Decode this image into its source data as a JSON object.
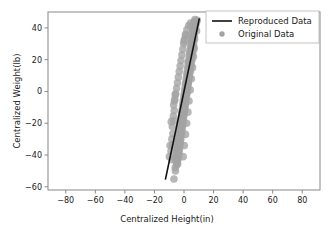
{
  "chart_data": {
    "type": "scatter",
    "title": "",
    "xlabel": "Centralized Height(in)",
    "ylabel": "Centralized Weight(lb)",
    "xlim": [
      -92,
      92
    ],
    "ylim": [
      -62,
      50
    ],
    "xticks": [
      -80,
      -60,
      -40,
      -20,
      0,
      20,
      40,
      60,
      80
    ],
    "xtick_labels": [
      "−80",
      "−60",
      "−40",
      "−20",
      "0",
      "20",
      "40",
      "60",
      "80"
    ],
    "yticks": [
      40,
      20,
      0,
      -20,
      -40,
      -60
    ],
    "ytick_labels": [
      "40",
      "20",
      "0",
      "−20",
      "−40",
      "−60"
    ],
    "grid": false,
    "legend_position": "upper right",
    "legend": [
      {
        "label": "Reproduced Data",
        "kind": "line",
        "color": "#101010"
      },
      {
        "label": "Original Data",
        "kind": "marker",
        "color": "#a3a3a3"
      }
    ],
    "series": [
      {
        "name": "Reproduced Data",
        "type": "line",
        "color": "#101010",
        "linewidth": 1.6,
        "x": [
          -12.6,
          10.4
        ],
        "y": [
          -55.5,
          46.0
        ]
      },
      {
        "name": "Original Data",
        "type": "scatter",
        "color": "#a3a3a3",
        "marker": "o",
        "marker_size": 5.2,
        "points": [
          [
            7.4,
            45.2
          ],
          [
            6.9,
            44.0
          ],
          [
            8.0,
            43.6
          ],
          [
            6.4,
            42.3
          ],
          [
            7.1,
            41.0
          ],
          [
            6.2,
            40.1
          ],
          [
            7.6,
            39.4
          ],
          [
            5.9,
            38.2
          ],
          [
            6.8,
            37.5
          ],
          [
            5.4,
            36.3
          ],
          [
            6.3,
            35.6
          ],
          [
            7.0,
            34.9
          ],
          [
            5.1,
            33.8
          ],
          [
            6.0,
            33.0
          ],
          [
            5.7,
            32.1
          ],
          [
            6.6,
            31.4
          ],
          [
            4.8,
            30.6
          ],
          [
            5.5,
            29.8
          ],
          [
            6.1,
            29.0
          ],
          [
            4.5,
            28.2
          ],
          [
            5.2,
            27.5
          ],
          [
            5.9,
            26.9
          ],
          [
            4.2,
            26.0
          ],
          [
            4.9,
            25.3
          ],
          [
            5.6,
            24.6
          ],
          [
            3.9,
            23.9
          ],
          [
            4.6,
            23.2
          ],
          [
            5.3,
            22.5
          ],
          [
            3.6,
            21.8
          ],
          [
            4.3,
            21.1
          ],
          [
            5.0,
            20.4
          ],
          [
            3.3,
            19.7
          ],
          [
            4.0,
            19.0
          ],
          [
            4.7,
            18.3
          ],
          [
            2.9,
            17.6
          ],
          [
            3.7,
            16.9
          ],
          [
            4.4,
            16.2
          ],
          [
            2.6,
            15.5
          ],
          [
            3.4,
            14.8
          ],
          [
            4.1,
            14.1
          ],
          [
            2.3,
            13.4
          ],
          [
            3.1,
            12.7
          ],
          [
            3.8,
            12.0
          ],
          [
            2.0,
            11.3
          ],
          [
            2.8,
            10.6
          ],
          [
            3.5,
            9.9
          ],
          [
            1.7,
            9.2
          ],
          [
            2.5,
            8.5
          ],
          [
            3.2,
            7.8
          ],
          [
            1.4,
            7.1
          ],
          [
            2.2,
            6.4
          ],
          [
            2.9,
            5.7
          ],
          [
            1.1,
            5.0
          ],
          [
            1.9,
            4.3
          ],
          [
            2.6,
            3.6
          ],
          [
            0.8,
            2.9
          ],
          [
            1.6,
            2.2
          ],
          [
            2.3,
            1.5
          ],
          [
            0.5,
            0.8
          ],
          [
            1.3,
            0.1
          ],
          [
            2.0,
            -0.6
          ],
          [
            0.2,
            -1.3
          ],
          [
            1.0,
            -2.0
          ],
          [
            1.7,
            -2.7
          ],
          [
            -0.1,
            -3.4
          ],
          [
            0.7,
            -4.1
          ],
          [
            1.4,
            -4.8
          ],
          [
            -0.4,
            -5.5
          ],
          [
            0.4,
            -6.2
          ],
          [
            1.1,
            -6.9
          ],
          [
            -0.7,
            -7.6
          ],
          [
            0.1,
            -8.3
          ],
          [
            0.8,
            -9.0
          ],
          [
            -1.0,
            -9.7
          ],
          [
            -0.2,
            -10.4
          ],
          [
            0.5,
            -11.1
          ],
          [
            -1.3,
            -11.8
          ],
          [
            -0.5,
            -12.5
          ],
          [
            0.2,
            -13.2
          ],
          [
            -1.6,
            -13.9
          ],
          [
            -0.8,
            -14.6
          ],
          [
            -0.1,
            -15.3
          ],
          [
            -1.9,
            -16.0
          ],
          [
            -1.1,
            -16.7
          ],
          [
            -0.4,
            -17.4
          ],
          [
            -2.2,
            -18.1
          ],
          [
            -1.4,
            -18.8
          ],
          [
            -0.7,
            -19.5
          ],
          [
            -2.5,
            -20.2
          ],
          [
            -1.7,
            -20.9
          ],
          [
            -1.0,
            -21.6
          ],
          [
            -2.8,
            -22.3
          ],
          [
            -2.0,
            -23.0
          ],
          [
            -1.3,
            -23.7
          ],
          [
            -3.1,
            -24.4
          ],
          [
            -2.3,
            -25.1
          ],
          [
            -1.6,
            -25.8
          ],
          [
            -3.4,
            -26.5
          ],
          [
            -2.6,
            -27.2
          ],
          [
            -1.9,
            -27.9
          ],
          [
            -3.7,
            -28.6
          ],
          [
            -2.9,
            -29.3
          ],
          [
            -2.2,
            -30.0
          ],
          [
            -4.0,
            -30.7
          ],
          [
            -3.2,
            -31.4
          ],
          [
            -2.5,
            -32.1
          ],
          [
            -4.3,
            -32.8
          ],
          [
            -3.5,
            -33.5
          ],
          [
            -2.8,
            -34.2
          ],
          [
            -4.6,
            -34.9
          ],
          [
            -3.8,
            -35.6
          ],
          [
            -3.1,
            -36.3
          ],
          [
            -4.9,
            -37.0
          ],
          [
            -4.1,
            -37.7
          ],
          [
            -3.4,
            -38.4
          ],
          [
            -5.2,
            -39.1
          ],
          [
            -4.4,
            -39.8
          ],
          [
            -3.7,
            -40.5
          ],
          [
            -5.5,
            -41.2
          ],
          [
            -4.7,
            -41.9
          ],
          [
            -4.0,
            -42.6
          ],
          [
            -5.3,
            -43.3
          ],
          [
            -4.6,
            -44.0
          ],
          [
            -5.0,
            -44.8
          ],
          [
            -4.3,
            -45.6
          ],
          [
            -6.8,
            -55.1
          ],
          [
            8.3,
            42.8
          ],
          [
            7.8,
            40.5
          ],
          [
            5.0,
            31.0
          ],
          [
            6.9,
            27.0
          ],
          [
            4.0,
            24.0
          ],
          [
            6.4,
            22.0
          ],
          [
            3.0,
            18.5
          ],
          [
            5.8,
            15.0
          ],
          [
            2.4,
            11.0
          ],
          [
            5.0,
            8.0
          ],
          [
            1.5,
            4.5
          ],
          [
            4.2,
            1.0
          ],
          [
            0.6,
            -2.5
          ],
          [
            3.4,
            -6.0
          ],
          [
            -0.3,
            -9.5
          ],
          [
            2.6,
            -13.0
          ],
          [
            -1.2,
            -16.5
          ],
          [
            1.8,
            -20.0
          ],
          [
            -2.1,
            -23.5
          ],
          [
            1.0,
            -27.0
          ],
          [
            -3.0,
            -30.5
          ],
          [
            0.2,
            -34.0
          ],
          [
            -3.9,
            -37.5
          ],
          [
            -0.6,
            -41.0
          ],
          [
            -4.8,
            -44.5
          ],
          [
            9.0,
            44.8
          ],
          [
            8.5,
            38.0
          ],
          [
            7.2,
            33.0
          ],
          [
            6.6,
            28.5
          ],
          [
            6.0,
            25.0
          ],
          [
            5.4,
            20.0
          ],
          [
            4.8,
            16.5
          ],
          [
            4.2,
            12.5
          ],
          [
            3.6,
            9.0
          ],
          [
            3.0,
            5.5
          ],
          [
            2.4,
            2.0
          ],
          [
            1.8,
            -1.5
          ],
          [
            1.2,
            -5.0
          ],
          [
            0.6,
            -8.5
          ],
          [
            0.0,
            -12.0
          ],
          [
            -0.6,
            -15.5
          ],
          [
            -1.2,
            -19.0
          ],
          [
            -1.8,
            -22.5
          ],
          [
            -2.4,
            -26.0
          ],
          [
            -3.0,
            -29.5
          ],
          [
            -3.6,
            -33.0
          ],
          [
            -4.2,
            -36.5
          ],
          [
            -4.8,
            -40.0
          ],
          [
            -5.4,
            -43.5
          ],
          [
            -5.1,
            -46.5
          ],
          [
            -8.2,
            -30.0
          ],
          [
            -7.5,
            -26.5
          ],
          [
            -7.9,
            -22.0
          ],
          [
            -8.6,
            -19.0
          ],
          [
            -7.2,
            -15.5
          ],
          [
            -6.6,
            -12.0
          ],
          [
            -7.0,
            -8.5
          ],
          [
            -6.2,
            -5.0
          ],
          [
            -5.6,
            -1.5
          ],
          [
            -5.0,
            2.0
          ],
          [
            -4.4,
            5.5
          ],
          [
            -3.8,
            9.0
          ],
          [
            -3.2,
            12.5
          ],
          [
            -2.6,
            16.0
          ],
          [
            -2.0,
            19.5
          ],
          [
            -1.4,
            23.0
          ],
          [
            -0.8,
            26.5
          ],
          [
            -0.2,
            30.0
          ],
          [
            0.4,
            33.0
          ],
          [
            1.0,
            36.0
          ],
          [
            -9.4,
            -34.0
          ],
          [
            -8.8,
            -37.5
          ],
          [
            -9.9,
            -41.0
          ],
          [
            -6.0,
            -48.0
          ],
          [
            -5.8,
            -50.0
          ],
          [
            2.0,
            39.0
          ],
          [
            3.2,
            41.5
          ],
          [
            4.4,
            43.0
          ],
          [
            1.2,
            35.0
          ],
          [
            0.0,
            31.5
          ],
          [
            -6.5,
            -6.0
          ],
          [
            -5.9,
            -2.0
          ],
          [
            -6.9,
            -18.5
          ],
          [
            -7.6,
            -33.5
          ],
          [
            -8.1,
            -43.0
          ]
        ]
      }
    ]
  }
}
